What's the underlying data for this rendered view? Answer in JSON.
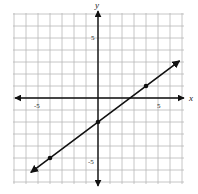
{
  "chart_data": {
    "type": "line",
    "title": "",
    "xlabel": "x",
    "ylabel": "y",
    "xlim": [
      -7,
      7
    ],
    "ylim": [
      -7,
      7
    ],
    "grid": true,
    "grid_step": 1,
    "x_tick_labels": [
      {
        "value": -5,
        "label": "-5"
      },
      {
        "value": 5,
        "label": "5"
      }
    ],
    "y_tick_labels": [
      {
        "value": 5,
        "label": "5"
      },
      {
        "value": -5,
        "label": "-5"
      }
    ],
    "series": [
      {
        "name": "line",
        "equation": "y = (3/4)x - 2",
        "slope": 0.75,
        "intercept": -2,
        "arrow_ends": [
          [
            -5.6,
            -6.2
          ],
          [
            6.8,
            3.1
          ]
        ],
        "marked_points": [
          [
            -4,
            -5
          ],
          [
            0,
            -2
          ],
          [
            4,
            1
          ]
        ]
      }
    ],
    "legend": null
  },
  "labels": {
    "x_axis": "x",
    "y_axis": "y",
    "x_neg5": "-5",
    "x_pos5": "5",
    "y_pos5": "5",
    "y_neg5": "-5"
  },
  "colors": {
    "grid": "#b8b8b8",
    "axis": "#111111",
    "line": "#111111",
    "point": "#111111",
    "background": "#ffffff"
  }
}
